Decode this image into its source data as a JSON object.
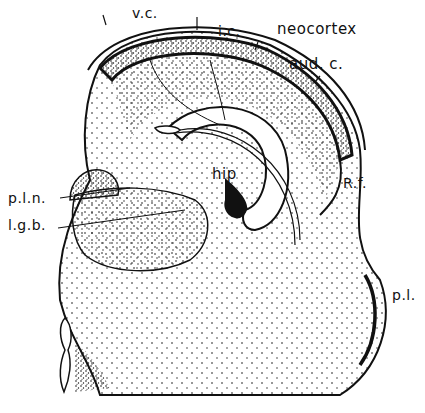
{
  "diagram": {
    "type": "anatomical-section",
    "style": "stippled line drawing",
    "colors": {
      "ink": "#111111",
      "background": "#ffffff"
    },
    "labels": {
      "vc": "v.c.",
      "ic": "i.c.",
      "neocortex": "neocortex",
      "audc": "aud. c.",
      "hip": "hip",
      "rf": "R.f.",
      "pln": "p.l.n.",
      "lgb": "l.g.b.",
      "pl": "p.l."
    }
  }
}
